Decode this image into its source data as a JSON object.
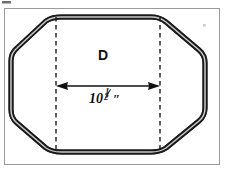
{
  "figure": {
    "type": "technical-drawing",
    "shape_label": "D",
    "dimension_label": {
      "whole": "10",
      "fraction_numerator": "1",
      "fraction_denominator": "2",
      "unit_symbol": "″",
      "full_text": "10½″"
    },
    "colors": {
      "background": "#ffffff",
      "outline": "#1a1a1a",
      "outline_core": "#b8b8b8",
      "frame": "#9a9a9a",
      "dashed_line": "#1a1a1a",
      "arrow": "#111111",
      "text": "#111111"
    },
    "geometry": {
      "frame": {
        "x": 4,
        "y": 8,
        "width": 216,
        "height": 157
      },
      "octagon_points": "52,17 160,17 203,52 203,122 160,152 52,152 14,122 14,52",
      "dashed_line_left_x": 56,
      "dashed_line_right_x": 160,
      "dimension_arrow_y": 86,
      "corner_radius": 9
    },
    "artifacts": [
      {
        "name": "scan-speck-top-left",
        "x": 2,
        "y": 1,
        "width": 9,
        "height": 3
      },
      {
        "name": "scan-speck-top-right",
        "x": 203,
        "y": 24,
        "width": 3,
        "height": 3
      }
    ]
  }
}
